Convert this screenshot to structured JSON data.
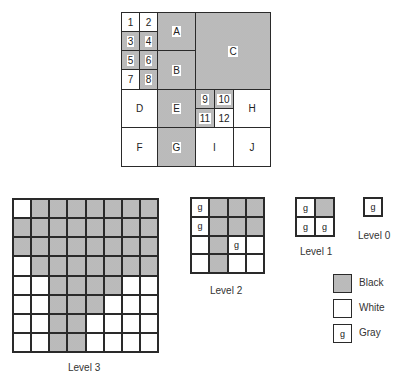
{
  "colors": {
    "black": "#d6d6d6",
    "white": "#ffffff",
    "border": "#2a2a2a"
  },
  "quadtree": {
    "regions": [
      {
        "id": "1",
        "color": "white"
      },
      {
        "id": "2",
        "color": "white"
      },
      {
        "id": "3",
        "color": "black"
      },
      {
        "id": "4",
        "color": "black"
      },
      {
        "id": "5",
        "color": "black"
      },
      {
        "id": "6",
        "color": "black"
      },
      {
        "id": "7",
        "color": "white"
      },
      {
        "id": "8",
        "color": "black"
      },
      {
        "id": "A",
        "color": "black"
      },
      {
        "id": "B",
        "color": "black"
      },
      {
        "id": "C",
        "color": "black"
      },
      {
        "id": "D",
        "color": "white"
      },
      {
        "id": "E",
        "color": "black"
      },
      {
        "id": "9",
        "color": "black"
      },
      {
        "id": "10",
        "color": "black"
      },
      {
        "id": "11",
        "color": "black"
      },
      {
        "id": "12",
        "color": "white"
      },
      {
        "id": "H",
        "color": "white"
      },
      {
        "id": "F",
        "color": "white"
      },
      {
        "id": "G",
        "color": "black"
      },
      {
        "id": "I",
        "color": "white"
      },
      {
        "id": "J",
        "color": "white"
      }
    ]
  },
  "levels": {
    "level3": {
      "caption": "Level 3",
      "cells": [
        [
          "W",
          "B",
          "B",
          "B",
          "B",
          "B",
          "B",
          "B"
        ],
        [
          "B",
          "B",
          "B",
          "B",
          "B",
          "B",
          "B",
          "B"
        ],
        [
          "B",
          "B",
          "B",
          "B",
          "B",
          "B",
          "B",
          "B"
        ],
        [
          "W",
          "B",
          "B",
          "B",
          "B",
          "B",
          "B",
          "B"
        ],
        [
          "W",
          "W",
          "B",
          "B",
          "B",
          "B",
          "W",
          "W"
        ],
        [
          "W",
          "W",
          "B",
          "B",
          "B",
          "W",
          "W",
          "W"
        ],
        [
          "W",
          "W",
          "B",
          "B",
          "W",
          "W",
          "W",
          "W"
        ],
        [
          "W",
          "W",
          "B",
          "B",
          "W",
          "W",
          "W",
          "W"
        ]
      ]
    },
    "level2": {
      "caption": "Level 2",
      "cells": [
        [
          "g",
          "B",
          "B",
          "B"
        ],
        [
          "g",
          "B",
          "B",
          "B"
        ],
        [
          "W",
          "B",
          "g",
          "W"
        ],
        [
          "W",
          "B",
          "W",
          "W"
        ]
      ]
    },
    "level1": {
      "caption": "Level 1",
      "cells": [
        [
          "g",
          "B"
        ],
        [
          "g",
          "g"
        ]
      ]
    },
    "level0": {
      "caption": "Level 0",
      "cells": [
        [
          "g"
        ]
      ]
    }
  },
  "legend": {
    "items": [
      {
        "label": "Black",
        "swatch": "black"
      },
      {
        "label": "White",
        "swatch": "white"
      },
      {
        "label": "Gray",
        "swatch": "gray",
        "glyph": "g"
      }
    ]
  },
  "gray_glyph": "g"
}
